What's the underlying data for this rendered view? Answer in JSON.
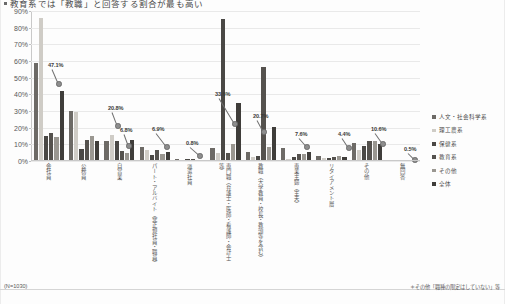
{
  "title": {
    "bullet": "●",
    "text": "教育系では「教職」と回答する割合が最も高い"
  },
  "footer": {
    "sample": "(N=1030)",
    "note": "＊その他「職種の限定はしていない」等"
  },
  "axis": {
    "yticks": [
      "90%",
      "80%",
      "70%",
      "60%",
      "50%",
      "40%",
      "30%",
      "20%",
      "10%",
      "0%"
    ]
  },
  "legend": {
    "position": "right",
    "items": [
      {
        "label": "人文・社会科学系",
        "color": "#6d6a66"
      },
      {
        "label": "理工農系",
        "color": "#cfccc6"
      },
      {
        "label": "保健系",
        "color": "#4a4845"
      },
      {
        "label": "教育系",
        "color": "#55524e"
      },
      {
        "label": "その他",
        "color": "#9a9791"
      },
      {
        "label": "全体",
        "color": "#3f3d3a"
      }
    ]
  },
  "callouts": [
    {
      "text": "47.1%",
      "x": 48,
      "y": 62,
      "dx": 6,
      "dy": 14
    },
    {
      "text": "20.8%",
      "x": 108,
      "y": 105,
      "dx": 5,
      "dy": 13
    },
    {
      "text": "6.8%",
      "x": 120,
      "y": 127,
      "dx": 4,
      "dy": 11
    },
    {
      "text": "6.9%",
      "x": 152,
      "y": 126,
      "dx": 10,
      "dy": 13
    },
    {
      "text": "0.8%",
      "x": 186,
      "y": 140,
      "dx": 9,
      "dy": 8
    },
    {
      "text": "33.6%",
      "x": 215,
      "y": 91,
      "dx": 15,
      "dy": 25
    },
    {
      "text": "20.7%",
      "x": 253,
      "y": 113,
      "dx": 6,
      "dy": 11
    },
    {
      "text": "7.6%",
      "x": 295,
      "y": 131,
      "dx": 7,
      "dy": 8
    },
    {
      "text": "4.4%",
      "x": 338,
      "y": 131,
      "dx": 6,
      "dy": 9
    },
    {
      "text": "10.6%",
      "x": 371,
      "y": 126,
      "dx": 7,
      "dy": 10
    },
    {
      "text": "0.5%",
      "x": 404,
      "y": 146,
      "dx": 6,
      "dy": 6
    }
  ],
  "chart_data": {
    "type": "bar",
    "title": "教育系では「教職」と回答する割合が最も高い",
    "xlabel": "",
    "ylabel": "",
    "ylim": [
      0,
      90
    ],
    "grid": true,
    "legend_position": "right",
    "categories": [
      "会社員",
      "公務員",
      "自営業",
      "パート・アルバイト（非正規社員・職員）",
      "派遣社員",
      "専門職（弁護士・医師・看護師・会計士等）",
      "教職（大学教員・校長・教頭等を含む）",
      "専業主婦（主夫）",
      "リタイアメント層",
      "その他",
      "無回答"
    ],
    "series": [
      {
        "name": "人文・社会科学系",
        "color": "#6d6a66",
        "values": [
          58.8,
          30.2,
          12.0,
          8.5,
          1.2,
          8.0,
          5.4,
          7.6,
          3.2,
          10.6,
          0.5
        ]
      },
      {
        "name": "理工農系",
        "color": "#cfccc6",
        "values": [
          86.0,
          29.6,
          15.4,
          6.8,
          0.8,
          4.8,
          2.2,
          1.4,
          2.0,
          6.4,
          0.4
        ]
      },
      {
        "name": "保健系",
        "color": "#4a4845",
        "values": [
          15.0,
          7.2,
          11.8,
          3.4,
          1.0,
          85.0,
          3.0,
          2.6,
          1.6,
          9.0,
          0.3
        ]
      },
      {
        "name": "教育系",
        "color": "#55524e",
        "values": [
          17.0,
          12.4,
          6.2,
          6.9,
          1.0,
          5.0,
          56.4,
          4.4,
          2.4,
          11.8,
          0.5
        ]
      },
      {
        "name": "その他",
        "color": "#9a9791",
        "values": [
          14.6,
          14.8,
          5.0,
          4.2,
          0.8,
          10.4,
          8.6,
          4.0,
          3.0,
          12.0,
          0.6
        ]
      },
      {
        "name": "全体",
        "color": "#3f3d3a",
        "values": [
          42.2,
          11.8,
          12.6,
          5.6,
          0.8,
          34.6,
          20.7,
          5.2,
          2.6,
          10.2,
          0.5
        ]
      }
    ],
    "data_labels": [
      {
        "value": 47.1,
        "text": "47.1%"
      },
      {
        "value": 20.8,
        "text": "20.8%"
      },
      {
        "value": 6.8,
        "text": "6.8%"
      },
      {
        "value": 6.9,
        "text": "6.9%"
      },
      {
        "value": 0.8,
        "text": "0.8%"
      },
      {
        "value": 33.6,
        "text": "33.6%"
      },
      {
        "value": 20.7,
        "text": "20.7%"
      },
      {
        "value": 7.6,
        "text": "7.6%"
      },
      {
        "value": 4.4,
        "text": "4.4%"
      },
      {
        "value": 10.6,
        "text": "10.6%"
      },
      {
        "value": 0.5,
        "text": "0.5%"
      }
    ]
  }
}
